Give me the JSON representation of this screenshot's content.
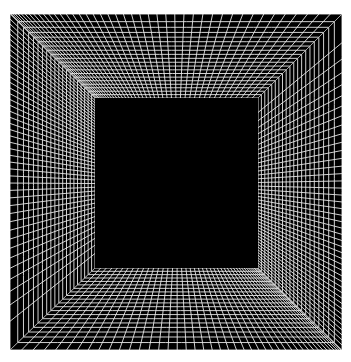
{
  "artwork": {
    "title": "Op-art perspective tunnel grid",
    "background_color": "#ffffff",
    "frame_color": "#000000",
    "line_color": "#e8e8e8",
    "line_width": 0.9,
    "outer_square": {
      "x1": 10,
      "y1": 14,
      "x2": 342,
      "y2": 350
    },
    "inner_square": {
      "x1": 95,
      "y1": 98,
      "x2": 258,
      "y2": 268
    },
    "walls": [
      {
        "name": "top",
        "outer": [
          [
            10,
            14
          ],
          [
            342,
            14
          ]
        ],
        "inner": [
          [
            95,
            98
          ],
          [
            258,
            98
          ]
        ],
        "depth_lines": 20,
        "radial_lines": 44,
        "depth_power": 1.25,
        "radial_power": 1.55
      },
      {
        "name": "right",
        "outer": [
          [
            342,
            14
          ],
          [
            342,
            350
          ]
        ],
        "inner": [
          [
            258,
            98
          ],
          [
            258,
            268
          ]
        ],
        "depth_lines": 20,
        "radial_lines": 44,
        "depth_power": 1.25,
        "radial_power": 0.65
      },
      {
        "name": "bottom",
        "outer": [
          [
            342,
            350
          ],
          [
            10,
            350
          ]
        ],
        "inner": [
          [
            258,
            268
          ],
          [
            95,
            268
          ]
        ],
        "depth_lines": 20,
        "radial_lines": 44,
        "depth_power": 1.25,
        "radial_power": 1.55
      },
      {
        "name": "left",
        "outer": [
          [
            10,
            350
          ],
          [
            10,
            14
          ]
        ],
        "inner": [
          [
            95,
            268
          ],
          [
            95,
            98
          ]
        ],
        "depth_lines": 20,
        "radial_lines": 44,
        "depth_power": 1.25,
        "radial_power": 0.65
      }
    ]
  }
}
